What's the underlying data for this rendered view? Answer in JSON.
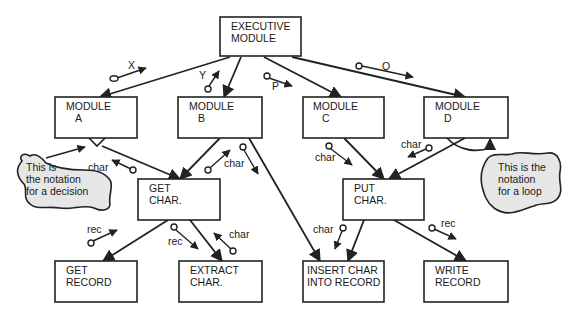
{
  "modules": [
    {
      "id": "executive",
      "line1": "EXECUTIVE",
      "line2": "MODULE",
      "x": 220,
      "y": 17,
      "w": 81,
      "h": 39
    },
    {
      "id": "module-a",
      "line1": "MODULE",
      "line2": "A",
      "x": 55,
      "y": 97,
      "w": 82,
      "h": 41
    },
    {
      "id": "module-b",
      "line1": "MODULE",
      "line2": "B",
      "x": 178,
      "y": 97,
      "w": 84,
      "h": 41
    },
    {
      "id": "module-c",
      "line1": "MODULE",
      "line2": "C",
      "x": 303,
      "y": 97,
      "w": 81,
      "h": 41
    },
    {
      "id": "module-d",
      "line1": "MODULE",
      "line2": "D",
      "x": 424,
      "y": 97,
      "w": 84,
      "h": 41
    },
    {
      "id": "get-char",
      "line1": "GET",
      "line2": "CHAR.",
      "x": 138,
      "y": 179,
      "w": 82,
      "h": 41
    },
    {
      "id": "put-char",
      "line1": "PUT",
      "line2": "CHAR.",
      "x": 343,
      "y": 179,
      "w": 81,
      "h": 41
    },
    {
      "id": "get-record",
      "line1": "GET",
      "line2": "RECORD",
      "x": 55,
      "y": 261,
      "w": 82,
      "h": 41
    },
    {
      "id": "extract-char",
      "line1": "EXTRACT",
      "line2": "CHAR.",
      "x": 179,
      "y": 261,
      "w": 83,
      "h": 41
    },
    {
      "id": "insert-char",
      "line1": "INSERT CHAR",
      "line2": "INTO RECORD",
      "x": 303,
      "y": 261,
      "w": 81,
      "h": 41
    },
    {
      "id": "write-record",
      "line1": "WRITE",
      "line2": "RECORD",
      "x": 424,
      "y": 261,
      "w": 84,
      "h": 41
    }
  ],
  "couples": [
    {
      "label": "X"
    },
    {
      "label": "Y"
    },
    {
      "label": "P"
    },
    {
      "label": "Q"
    },
    {
      "label": "char"
    },
    {
      "label": "char"
    },
    {
      "label": "char"
    },
    {
      "label": "char"
    },
    {
      "label": "char"
    },
    {
      "label": "rec"
    },
    {
      "label": "rec"
    },
    {
      "label": "char"
    },
    {
      "label": "char"
    },
    {
      "label": "rec"
    }
  ],
  "notes": {
    "decision": {
      "line1": "This is",
      "line2": "the notation",
      "line3": "for a decision"
    },
    "loop": {
      "line1": "This is the",
      "line2": "notation",
      "line3": "for a loop"
    }
  }
}
